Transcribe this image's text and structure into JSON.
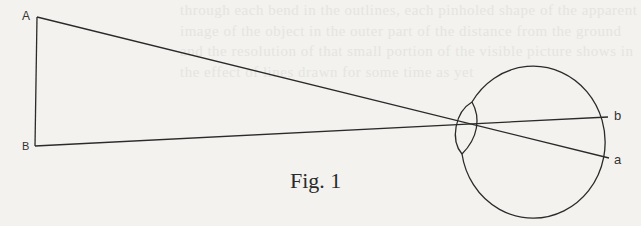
{
  "figure": {
    "caption": "Fig. 1",
    "labels": {
      "A": "A",
      "B": "B",
      "a": "a",
      "b": "b"
    },
    "colors": {
      "ink": "#2a2a2a",
      "paper": "#f3f2ef",
      "show_through": "#e6e4df"
    },
    "geometry": {
      "A": [
        37,
        17
      ],
      "B": [
        35,
        146
      ],
      "crossing": [
        473,
        127
      ],
      "point_b": [
        608,
        117
      ],
      "point_a": [
        609,
        158
      ],
      "eye_center": [
        543,
        130
      ],
      "eye_radius": [
        72,
        76
      ]
    }
  },
  "background_show_through": "through each bend in the outlines, each pinholed shape of the apparent image of the object in the outer part of the distance from the ground and the resolution of that small portion of the visible picture shows in the effect of lines drawn for some time as yet"
}
